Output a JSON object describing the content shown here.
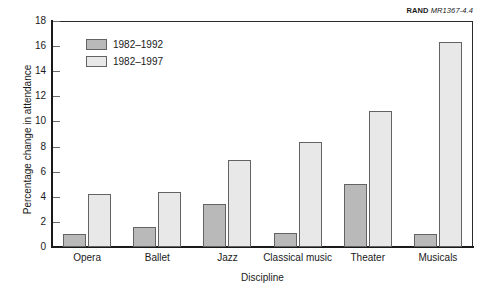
{
  "figure": {
    "corner_id_prefix": "RAND",
    "corner_id_code": "MR1367-4.4"
  },
  "chart_data": {
    "type": "bar",
    "title": "",
    "subtitle": "",
    "xlabel": "Discipline",
    "ylabel": "Percentage change in attendance",
    "categories": [
      "Opera",
      "Ballet",
      "Jazz",
      "Classical music",
      "Theater",
      "Musicals"
    ],
    "series": [
      {
        "name": "1982–1992",
        "color": "#b9b9b9",
        "values": [
          1.0,
          1.6,
          3.4,
          1.1,
          5.0,
          1.0
        ]
      },
      {
        "name": "1982–1997",
        "color": "#e8e8e8",
        "values": [
          4.2,
          4.4,
          6.9,
          8.4,
          10.8,
          16.3
        ]
      }
    ],
    "ylim": [
      0,
      18
    ],
    "yticks": [
      0,
      2,
      4,
      6,
      8,
      10,
      12,
      14,
      16,
      18
    ],
    "ytick_labels": [
      "0",
      "2",
      "4",
      "6",
      "8",
      "10",
      "12",
      "14",
      "16",
      "18"
    ],
    "grid": false,
    "legend_position": "upper left",
    "bar_edge_color": "#636363",
    "axis_color": "#1a1a1a"
  }
}
